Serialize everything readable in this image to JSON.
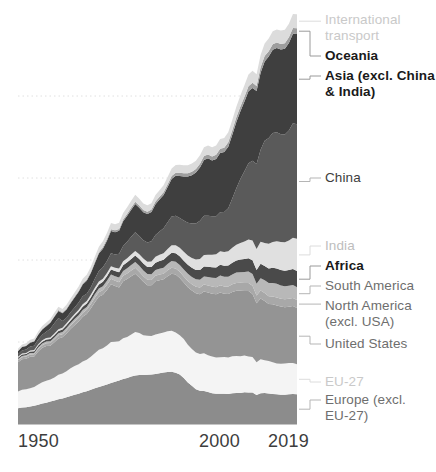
{
  "chart_data": {
    "type": "area",
    "stacked": true,
    "title": "",
    "subtitle": "",
    "xlabel": "",
    "ylabel": "",
    "grid": true,
    "grid_style": "dotted-horizontal",
    "legend_position": "right-inline-labels",
    "xlim": [
      1950,
      2019
    ],
    "x_ticks": [
      "1950",
      "2000",
      "2019"
    ],
    "x_tick_values": [
      1950,
      2000,
      2019
    ],
    "x": [
      1950,
      1951,
      1952,
      1953,
      1954,
      1955,
      1956,
      1957,
      1958,
      1959,
      1960,
      1961,
      1962,
      1963,
      1964,
      1965,
      1966,
      1967,
      1968,
      1969,
      1970,
      1971,
      1972,
      1973,
      1974,
      1975,
      1976,
      1977,
      1978,
      1979,
      1980,
      1981,
      1982,
      1983,
      1984,
      1985,
      1986,
      1987,
      1988,
      1989,
      1990,
      1991,
      1992,
      1993,
      1994,
      1995,
      1996,
      1997,
      1998,
      1999,
      2000,
      2001,
      2002,
      2003,
      2004,
      2005,
      2006,
      2007,
      2008,
      2009,
      2010,
      2011,
      2012,
      2013,
      2014,
      2015,
      2016,
      2017,
      2018,
      2019
    ],
    "series": [
      {
        "name": "Europe (excl. EU-27)",
        "color": "#8c8c8c",
        "label_color": "#6e6e6e",
        "values": [
          1.4,
          1.46,
          1.5,
          1.56,
          1.62,
          1.72,
          1.82,
          1.9,
          2.0,
          2.1,
          2.2,
          2.28,
          2.38,
          2.5,
          2.6,
          2.7,
          2.82,
          2.92,
          3.04,
          3.18,
          3.3,
          3.4,
          3.52,
          3.66,
          3.76,
          3.88,
          4.0,
          4.1,
          4.22,
          4.32,
          4.36,
          4.36,
          4.38,
          4.4,
          4.46,
          4.52,
          4.58,
          4.64,
          4.66,
          4.56,
          4.4,
          4.1,
          3.7,
          3.4,
          3.1,
          2.96,
          2.94,
          2.84,
          2.74,
          2.7,
          2.7,
          2.7,
          2.68,
          2.74,
          2.76,
          2.76,
          2.82,
          2.8,
          2.8,
          2.58,
          2.74,
          2.76,
          2.72,
          2.68,
          2.64,
          2.6,
          2.6,
          2.64,
          2.66,
          2.64
        ]
      },
      {
        "name": "EU-27",
        "color": "#f4f4f4",
        "label_color": "#c9c9c9",
        "values": [
          1.5,
          1.58,
          1.6,
          1.62,
          1.68,
          1.8,
          1.9,
          1.96,
          1.96,
          2.04,
          2.18,
          2.22,
          2.32,
          2.46,
          2.56,
          2.62,
          2.74,
          2.8,
          2.94,
          3.12,
          3.3,
          3.34,
          3.46,
          3.64,
          3.56,
          3.48,
          3.64,
          3.64,
          3.74,
          3.86,
          3.74,
          3.54,
          3.48,
          3.44,
          3.5,
          3.54,
          3.56,
          3.62,
          3.64,
          3.58,
          3.5,
          3.46,
          3.36,
          3.28,
          3.26,
          3.28,
          3.36,
          3.28,
          3.28,
          3.22,
          3.24,
          3.26,
          3.24,
          3.3,
          3.3,
          3.28,
          3.28,
          3.22,
          3.16,
          2.92,
          3.02,
          2.92,
          2.88,
          2.82,
          2.74,
          2.76,
          2.78,
          2.8,
          2.76,
          2.68
        ]
      },
      {
        "name": "United States",
        "color": "#949494",
        "label_color": "#6e6e6e",
        "values": [
          2.6,
          2.72,
          2.7,
          2.8,
          2.7,
          2.94,
          3.06,
          3.08,
          3.0,
          3.14,
          3.24,
          3.22,
          3.36,
          3.5,
          3.64,
          3.8,
          3.98,
          4.08,
          4.3,
          4.54,
          4.72,
          4.76,
          4.96,
          5.14,
          4.96,
          4.8,
          5.06,
          5.16,
          5.2,
          5.2,
          4.94,
          4.76,
          4.5,
          4.52,
          4.74,
          4.74,
          4.74,
          4.9,
          5.08,
          5.16,
          5.1,
          5.04,
          5.12,
          5.2,
          5.28,
          5.32,
          5.5,
          5.58,
          5.58,
          5.62,
          5.76,
          5.64,
          5.66,
          5.72,
          5.8,
          5.82,
          5.74,
          5.82,
          5.62,
          5.26,
          5.42,
          5.28,
          5.08,
          5.16,
          5.18,
          5.1,
          5.02,
          5.0,
          5.08,
          5.0
        ]
      },
      {
        "name": "North America (excl. USA)",
        "color": "#a8a8a8",
        "label_color": "#6e6e6e",
        "values": [
          0.18,
          0.19,
          0.2,
          0.21,
          0.21,
          0.23,
          0.24,
          0.25,
          0.25,
          0.26,
          0.27,
          0.28,
          0.29,
          0.3,
          0.32,
          0.33,
          0.35,
          0.36,
          0.38,
          0.4,
          0.42,
          0.43,
          0.45,
          0.48,
          0.48,
          0.47,
          0.49,
          0.5,
          0.51,
          0.53,
          0.52,
          0.5,
          0.48,
          0.47,
          0.49,
          0.5,
          0.5,
          0.52,
          0.54,
          0.55,
          0.55,
          0.54,
          0.56,
          0.56,
          0.58,
          0.59,
          0.61,
          0.62,
          0.63,
          0.64,
          0.66,
          0.65,
          0.66,
          0.68,
          0.7,
          0.71,
          0.71,
          0.72,
          0.72,
          0.68,
          0.7,
          0.7,
          0.69,
          0.7,
          0.71,
          0.7,
          0.7,
          0.71,
          0.72,
          0.71
        ]
      },
      {
        "name": "South America",
        "color": "#b8b8b8",
        "label_color": "#6e6e6e",
        "values": [
          0.1,
          0.11,
          0.11,
          0.12,
          0.12,
          0.13,
          0.14,
          0.15,
          0.16,
          0.17,
          0.18,
          0.19,
          0.2,
          0.21,
          0.22,
          0.24,
          0.25,
          0.26,
          0.28,
          0.3,
          0.32,
          0.34,
          0.36,
          0.39,
          0.4,
          0.41,
          0.44,
          0.46,
          0.48,
          0.51,
          0.52,
          0.51,
          0.51,
          0.5,
          0.51,
          0.52,
          0.54,
          0.56,
          0.58,
          0.59,
          0.6,
          0.61,
          0.63,
          0.65,
          0.67,
          0.7,
          0.73,
          0.77,
          0.8,
          0.82,
          0.85,
          0.85,
          0.86,
          0.88,
          0.92,
          0.95,
          0.98,
          1.02,
          1.06,
          1.04,
          1.1,
          1.14,
          1.18,
          1.2,
          1.22,
          1.18,
          1.16,
          1.16,
          1.16,
          1.14
        ]
      },
      {
        "name": "Africa",
        "color": "#4a4a4a",
        "label_color": "#1a1a1a",
        "values": [
          0.12,
          0.13,
          0.13,
          0.14,
          0.15,
          0.16,
          0.17,
          0.18,
          0.19,
          0.2,
          0.21,
          0.22,
          0.24,
          0.25,
          0.27,
          0.28,
          0.3,
          0.31,
          0.33,
          0.35,
          0.37,
          0.39,
          0.41,
          0.44,
          0.45,
          0.47,
          0.5,
          0.53,
          0.55,
          0.58,
          0.6,
          0.61,
          0.63,
          0.64,
          0.66,
          0.68,
          0.7,
          0.72,
          0.74,
          0.76,
          0.78,
          0.79,
          0.8,
          0.81,
          0.83,
          0.86,
          0.88,
          0.9,
          0.92,
          0.94,
          0.96,
          0.98,
          1.0,
          1.04,
          1.08,
          1.12,
          1.15,
          1.18,
          1.22,
          1.24,
          1.28,
          1.26,
          1.3,
          1.34,
          1.36,
          1.38,
          1.38,
          1.4,
          1.42,
          1.44
        ]
      },
      {
        "name": "India",
        "color": "#e0e0e0",
        "label_color": "#bdbdbd",
        "values": [
          0.08,
          0.09,
          0.09,
          0.1,
          0.1,
          0.11,
          0.12,
          0.13,
          0.13,
          0.14,
          0.15,
          0.16,
          0.17,
          0.18,
          0.19,
          0.2,
          0.21,
          0.22,
          0.23,
          0.25,
          0.26,
          0.27,
          0.28,
          0.3,
          0.31,
          0.33,
          0.35,
          0.37,
          0.38,
          0.41,
          0.43,
          0.45,
          0.47,
          0.5,
          0.53,
          0.56,
          0.59,
          0.63,
          0.67,
          0.71,
          0.75,
          0.8,
          0.84,
          0.87,
          0.92,
          0.98,
          1.03,
          1.08,
          1.12,
          1.17,
          1.2,
          1.23,
          1.27,
          1.32,
          1.4,
          1.48,
          1.56,
          1.66,
          1.76,
          1.86,
          1.96,
          2.06,
          2.2,
          2.3,
          2.42,
          2.48,
          2.54,
          2.62,
          2.78,
          2.88
        ]
      },
      {
        "name": "China",
        "color": "#5a5a5a",
        "label_color": "#3d3d3d",
        "values": [
          0.22,
          0.27,
          0.3,
          0.34,
          0.38,
          0.43,
          0.5,
          0.56,
          0.78,
          0.92,
          1.0,
          0.6,
          0.5,
          0.54,
          0.58,
          0.64,
          0.72,
          0.64,
          0.66,
          0.78,
          0.92,
          1.02,
          1.08,
          1.16,
          1.18,
          1.32,
          1.36,
          1.46,
          1.6,
          1.66,
          1.62,
          1.62,
          1.7,
          1.8,
          1.94,
          2.08,
          2.22,
          2.38,
          2.56,
          2.64,
          2.66,
          2.78,
          2.9,
          3.08,
          3.22,
          3.4,
          3.5,
          3.48,
          3.42,
          3.38,
          3.48,
          3.56,
          3.84,
          4.4,
          5.02,
          5.68,
          6.26,
          6.8,
          7.1,
          7.56,
          8.2,
          9.1,
          9.4,
          9.7,
          9.7,
          9.6,
          9.6,
          9.8,
          10.2,
          10.2
        ]
      },
      {
        "name": "Asia (excl. China & India)",
        "color": "#3f3f3f",
        "label_color": "#1a1a1a",
        "values": [
          0.28,
          0.3,
          0.32,
          0.35,
          0.38,
          0.42,
          0.46,
          0.5,
          0.54,
          0.58,
          0.64,
          0.68,
          0.74,
          0.8,
          0.88,
          0.96,
          1.06,
          1.16,
          1.26,
          1.4,
          1.56,
          1.66,
          1.8,
          1.98,
          1.98,
          2.04,
          2.2,
          2.32,
          2.4,
          2.52,
          2.52,
          2.5,
          2.54,
          2.6,
          2.74,
          2.84,
          2.96,
          3.12,
          3.34,
          3.54,
          3.74,
          3.92,
          4.12,
          4.3,
          4.52,
          4.74,
          4.96,
          5.1,
          4.96,
          5.1,
          5.28,
          5.34,
          5.48,
          5.66,
          5.9,
          6.04,
          6.2,
          6.4,
          6.48,
          6.5,
          6.86,
          7.06,
          7.26,
          7.42,
          7.5,
          7.54,
          7.62,
          7.78,
          7.96,
          8.02
        ]
      },
      {
        "name": "Oceania",
        "color": "#9e9e9e",
        "label_color": "#1a1a1a",
        "values": [
          0.04,
          0.04,
          0.04,
          0.05,
          0.05,
          0.05,
          0.06,
          0.06,
          0.06,
          0.07,
          0.07,
          0.08,
          0.08,
          0.09,
          0.09,
          0.1,
          0.1,
          0.11,
          0.12,
          0.12,
          0.13,
          0.14,
          0.15,
          0.15,
          0.16,
          0.17,
          0.17,
          0.18,
          0.19,
          0.2,
          0.2,
          0.21,
          0.21,
          0.22,
          0.23,
          0.24,
          0.25,
          0.26,
          0.27,
          0.28,
          0.29,
          0.29,
          0.3,
          0.31,
          0.32,
          0.33,
          0.34,
          0.35,
          0.36,
          0.37,
          0.38,
          0.39,
          0.4,
          0.41,
          0.42,
          0.43,
          0.44,
          0.45,
          0.46,
          0.46,
          0.47,
          0.48,
          0.48,
          0.49,
          0.49,
          0.5,
          0.5,
          0.51,
          0.52,
          0.52
        ]
      },
      {
        "name": "International transport",
        "color": "#dcdcdc",
        "label_color": "#c9c9c9",
        "values": [
          0.18,
          0.19,
          0.2,
          0.21,
          0.22,
          0.24,
          0.25,
          0.26,
          0.27,
          0.29,
          0.3,
          0.31,
          0.33,
          0.34,
          0.36,
          0.38,
          0.4,
          0.42,
          0.44,
          0.46,
          0.49,
          0.51,
          0.53,
          0.56,
          0.55,
          0.55,
          0.57,
          0.58,
          0.6,
          0.62,
          0.6,
          0.58,
          0.57,
          0.57,
          0.59,
          0.6,
          0.62,
          0.64,
          0.66,
          0.68,
          0.7,
          0.7,
          0.71,
          0.72,
          0.74,
          0.76,
          0.78,
          0.8,
          0.82,
          0.84,
          0.87,
          0.87,
          0.88,
          0.91,
          0.95,
          0.98,
          1.01,
          1.05,
          1.07,
          1.04,
          1.09,
          1.12,
          1.13,
          1.15,
          1.17,
          1.18,
          1.2,
          1.22,
          1.24,
          1.25
        ]
      }
    ]
  },
  "axis": {
    "ticks": [
      {
        "label": "1950",
        "value": 1950
      },
      {
        "label": "2000",
        "value": 2000
      },
      {
        "label": "2019",
        "value": 2019
      }
    ]
  },
  "labels": [
    {
      "key": "international-transport",
      "text": "International\ntransport",
      "color": "#c9c9c9"
    },
    {
      "key": "oceania",
      "text": "Oceania",
      "color": "#1a1a1a"
    },
    {
      "key": "asia-excl-china-india",
      "text": "Asia (excl. China\n& India)",
      "color": "#1a1a1a"
    },
    {
      "key": "china",
      "text": "China",
      "color": "#3d3d3d"
    },
    {
      "key": "india",
      "text": "India",
      "color": "#bdbdbd"
    },
    {
      "key": "africa",
      "text": "Africa",
      "color": "#1a1a1a"
    },
    {
      "key": "south-america",
      "text": "South America",
      "color": "#6e6e6e"
    },
    {
      "key": "north-america-excl-usa",
      "text": "North America\n(excl. USA)",
      "color": "#6e6e6e"
    },
    {
      "key": "united-states",
      "text": "United States",
      "color": "#6e6e6e"
    },
    {
      "key": "eu-27",
      "text": "EU-27",
      "color": "#c9c9c9"
    },
    {
      "key": "europe-excl-eu-27",
      "text": "Europe (excl.\nEU-27)",
      "color": "#6e6e6e"
    }
  ]
}
